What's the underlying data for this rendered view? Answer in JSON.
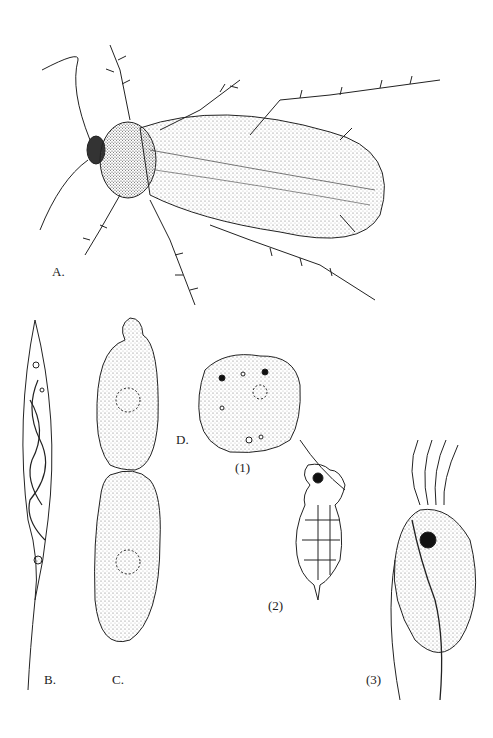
{
  "figure": {
    "labels": {
      "a": "A.",
      "b": "B.",
      "c": "C.",
      "d": "D.",
      "d1": "(1)",
      "d2": "(2)",
      "d3": "(3)"
    },
    "subjects": {
      "a": "cockroach",
      "b": "elongated protozoan with internal coiled structures",
      "c": "dividing cyst-like cell with two nuclei",
      "d1": "amoeboid cell",
      "d2": "flagellate with chambered body",
      "d3": "multiflagellated protozoan"
    },
    "colors": {
      "ink": "#222222",
      "background": "#ffffff"
    }
  }
}
